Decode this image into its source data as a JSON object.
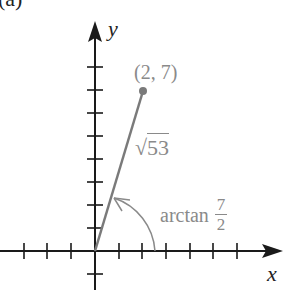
{
  "figure": {
    "panel_label": "(a)",
    "x_axis_label": "x",
    "y_axis_label": "y",
    "point_label": "(2, 7)",
    "segment_label_radical": "√",
    "segment_label_value": "53",
    "angle_label_prefix": "arctan",
    "angle_label_numerator": "7",
    "angle_label_denominator": "2",
    "colors": {
      "axis": "#1a1a1a",
      "segment": "#7a7a7a",
      "label": "#8a8a8a"
    }
  }
}
